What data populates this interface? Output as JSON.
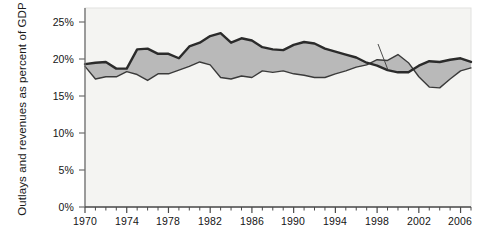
{
  "chart_data": {
    "type": "area",
    "title": "",
    "subtitle": "",
    "xlabel": "",
    "ylabel": "Outlays and revenues as percent of GDP",
    "ylim": [
      0,
      25
    ],
    "xlim": [
      1970,
      2007
    ],
    "grid": false,
    "legend_position": "inline-annotations",
    "y_ticks": [
      "0%",
      "5%",
      "10%",
      "15%",
      "20%",
      "25%"
    ],
    "y_tick_values": [
      0,
      5,
      10,
      15,
      20,
      25
    ],
    "x_ticks": [
      "1970",
      "1974",
      "1978",
      "1982",
      "1986",
      "1990",
      "1994",
      "1998",
      "2002",
      "2006"
    ],
    "x_tick_values": [
      1970,
      1974,
      1978,
      1982,
      1986,
      1990,
      1994,
      1998,
      2002,
      2006
    ],
    "x_minor_tick_step": 1,
    "annotations": [
      {
        "name": "outlays-label",
        "text": "Outlays",
        "x": 1980,
        "y": 24.2
      },
      {
        "name": "deficits-label",
        "text": "Deficits",
        "x": 1985.5,
        "y": 20.3
      },
      {
        "name": "revenues-label",
        "text": "Revenues",
        "x": 1991.5,
        "y": 16.4
      },
      {
        "name": "surpluses-label",
        "text": "Surpluses",
        "x": 1998.5,
        "y": 23.4
      }
    ],
    "x": [
      1970,
      1971,
      1972,
      1973,
      1974,
      1975,
      1976,
      1977,
      1978,
      1979,
      1980,
      1981,
      1982,
      1983,
      1984,
      1985,
      1986,
      1987,
      1988,
      1989,
      1990,
      1991,
      1992,
      1993,
      1994,
      1995,
      1996,
      1997,
      1998,
      1999,
      2000,
      2001,
      2002,
      2003,
      2004,
      2005,
      2006,
      2007
    ],
    "series": [
      {
        "name": "Outlays",
        "color": "#2b2b2b",
        "values": [
          19.3,
          19.5,
          19.6,
          18.7,
          18.7,
          21.3,
          21.4,
          20.7,
          20.7,
          20.1,
          21.7,
          22.2,
          23.1,
          23.5,
          22.2,
          22.8,
          22.5,
          21.6,
          21.3,
          21.2,
          21.9,
          22.3,
          22.1,
          21.4,
          21.0,
          20.6,
          20.2,
          19.5,
          19.1,
          18.5,
          18.2,
          18.2,
          19.1,
          19.7,
          19.6,
          19.9,
          20.1,
          19.6
        ]
      },
      {
        "name": "Revenues",
        "color": "#2b2b2b",
        "values": [
          19.0,
          17.3,
          17.6,
          17.6,
          18.3,
          17.9,
          17.1,
          18.0,
          18.0,
          18.5,
          19.0,
          19.6,
          19.2,
          17.5,
          17.3,
          17.7,
          17.5,
          18.4,
          18.2,
          18.4,
          18.0,
          17.8,
          17.5,
          17.5,
          18.0,
          18.4,
          18.9,
          19.2,
          19.9,
          19.8,
          20.6,
          19.5,
          17.6,
          16.2,
          16.1,
          17.3,
          18.4,
          18.8
        ]
      }
    ],
    "fill_regions": [
      {
        "name": "Deficits",
        "description": "gray fill where Outlays exceed Revenues",
        "color": "#b9b9b9"
      },
      {
        "name": "Surpluses",
        "description": "gray fill where Revenues exceed Outlays (1998-2001)",
        "color": "#b9b9b9"
      }
    ]
  },
  "axis": {
    "y_title": "Outlays and revenues as percent of GDP"
  },
  "colors": {
    "plot_background": "#f4f4f2",
    "fill": "#b9b9b9",
    "outlays_line": "#2b2b2b",
    "revenues_line": "#3a3a3a",
    "axis": "#6e6e6e",
    "text": "#141414"
  }
}
